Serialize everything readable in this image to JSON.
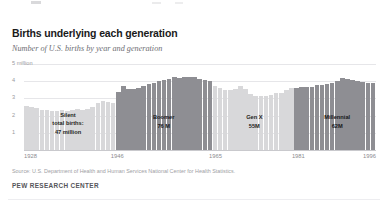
{
  "title": "Births underlying each generation",
  "subtitle": "Number of U.S. births by year and generation",
  "source": "Source: U.S. Department of Health and Human Services National Center for Health Statistics.",
  "brand": "PEW RESEARCH CENTER",
  "colors": {
    "bar_light": "#d8d8da",
    "bar_dark": "#8e8e93",
    "gridline": "#e6e6e9",
    "axis": "#c9c9cd",
    "title": "#1a1a1a",
    "subtitle": "#6e6e73",
    "source": "#a0a0a4",
    "brand": "#55555a"
  },
  "chart_data": {
    "type": "bar",
    "title": "Births underlying each generation",
    "subtitle": "Number of U.S. births by year and generation",
    "xlabel": "",
    "ylabel": "",
    "ylim": [
      0,
      5
    ],
    "yticks": [
      1,
      2,
      3,
      4,
      5
    ],
    "ytick_labels": [
      "1",
      "2",
      "3",
      "4",
      "5 million"
    ],
    "grid": true,
    "legend": "none",
    "xtick_labels": [
      "1928",
      "1946",
      "1965",
      "1981",
      "1996"
    ],
    "xtick_years": [
      1928,
      1946,
      1965,
      1981,
      1996
    ],
    "units": "millions of births",
    "x": [
      1928,
      1929,
      1930,
      1931,
      1932,
      1933,
      1934,
      1935,
      1936,
      1937,
      1938,
      1939,
      1940,
      1941,
      1942,
      1943,
      1944,
      1945,
      1946,
      1947,
      1948,
      1949,
      1950,
      1951,
      1952,
      1953,
      1954,
      1955,
      1956,
      1957,
      1958,
      1959,
      1960,
      1961,
      1962,
      1963,
      1964,
      1965,
      1966,
      1967,
      1968,
      1969,
      1970,
      1971,
      1972,
      1973,
      1974,
      1975,
      1976,
      1977,
      1978,
      1979,
      1980,
      1981,
      1982,
      1983,
      1984,
      1985,
      1986,
      1987,
      1988,
      1989,
      1990,
      1991,
      1992,
      1993,
      1994,
      1995,
      1996
    ],
    "values": [
      2.55,
      2.5,
      2.44,
      2.35,
      2.3,
      2.25,
      2.28,
      2.3,
      2.28,
      2.32,
      2.36,
      2.35,
      2.4,
      2.5,
      2.75,
      2.85,
      2.8,
      2.75,
      3.4,
      3.75,
      3.55,
      3.55,
      3.6,
      3.75,
      3.85,
      3.9,
      4.0,
      4.05,
      4.15,
      4.25,
      4.2,
      4.25,
      4.25,
      4.25,
      4.15,
      4.05,
      4.0,
      3.75,
      3.6,
      3.5,
      3.5,
      3.55,
      3.7,
      3.55,
      3.25,
      3.15,
      3.15,
      3.15,
      3.17,
      3.3,
      3.33,
      3.49,
      3.61,
      3.63,
      3.68,
      3.64,
      3.67,
      3.76,
      3.76,
      3.81,
      3.91,
      4.02,
      4.16,
      4.11,
      4.07,
      4.0,
      3.95,
      3.9,
      3.89
    ],
    "series_note": "single series, bar color encodes generation",
    "generations": [
      {
        "name": "Silent",
        "label_lines": [
          "Silent",
          "total births:",
          "47 million"
        ],
        "total_births": "47 million",
        "start_year": 1928,
        "end_year": 1945,
        "color": "#d8d8da",
        "shade": "light"
      },
      {
        "name": "Boomer",
        "label_lines": [
          "Boomer",
          "76 M"
        ],
        "total_births": "76 M",
        "start_year": 1946,
        "end_year": 1964,
        "color": "#8e8e93",
        "shade": "dark"
      },
      {
        "name": "Gen X",
        "label_lines": [
          "Gen X",
          "55M"
        ],
        "total_births": "55M",
        "start_year": 1965,
        "end_year": 1980,
        "color": "#d8d8da",
        "shade": "light"
      },
      {
        "name": "Millennial",
        "label_lines": [
          "Millennial",
          "62M"
        ],
        "total_births": "62M",
        "start_year": 1981,
        "end_year": 1996,
        "color": "#8e8e93",
        "shade": "dark"
      }
    ]
  }
}
